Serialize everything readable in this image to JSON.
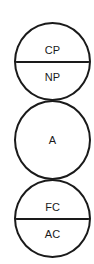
{
  "diagram": {
    "stroke_color": "#1a1a1a",
    "background": "#ffffff",
    "nodes": [
      {
        "type": "split",
        "top": "CP",
        "bottom": "NP"
      },
      {
        "type": "single",
        "label": "A"
      },
      {
        "type": "split",
        "top": "FC",
        "bottom": "AC"
      }
    ]
  }
}
